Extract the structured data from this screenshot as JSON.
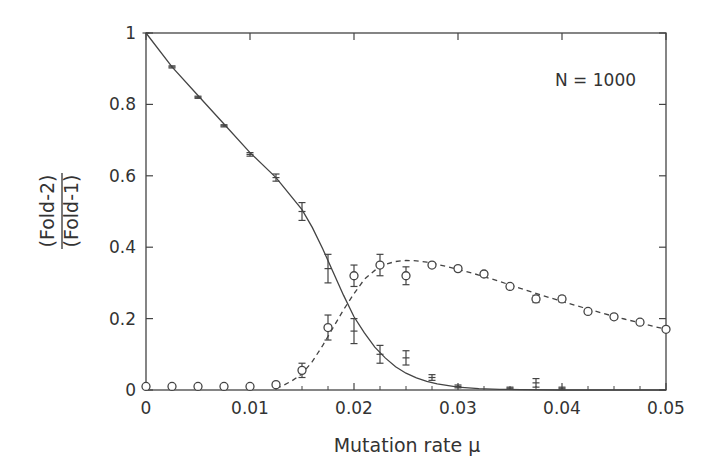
{
  "chart_data": {
    "type": "line",
    "title": "",
    "annotation": "N = 1000",
    "xlabel": "Mutation rate μ",
    "ylabel_numerator": "(Fold-2)",
    "ylabel_denominator": "(Fold-1)",
    "xlim": [
      0,
      0.05
    ],
    "ylim": [
      0,
      1
    ],
    "x_ticks": [
      0,
      0.01,
      0.02,
      0.03,
      0.04,
      0.05
    ],
    "x_tick_labels": [
      "0",
      "0.01",
      "0.02",
      "0.03",
      "0.04",
      "0.05"
    ],
    "x_minor_ticks": [
      0.0025,
      0.005,
      0.0075,
      0.0125,
      0.015,
      0.0175,
      0.0225,
      0.025,
      0.0275,
      0.0325,
      0.035,
      0.0375,
      0.0425,
      0.045,
      0.0475
    ],
    "y_ticks": [
      0,
      0.2,
      0.4,
      0.6,
      0.8,
      1
    ],
    "y_tick_labels": [
      "0",
      "0.2",
      "0.4",
      "0.6",
      "0.8",
      "1"
    ],
    "grid": false,
    "legend": null,
    "series": [
      {
        "name": "Fold-1 (simulation, bars)",
        "style": "solid",
        "marker": "bar",
        "x": [
          0,
          0.0025,
          0.005,
          0.0075,
          0.01,
          0.0125,
          0.015,
          0.0175,
          0.02,
          0.0225,
          0.025,
          0.0275,
          0.03,
          0.035,
          0.0375,
          0.04
        ],
        "y": [
          1.0,
          0.905,
          0.82,
          0.74,
          0.66,
          0.595,
          0.5,
          0.34,
          0.165,
          0.1,
          0.09,
          0.035,
          0.01,
          0.005,
          0.02,
          0.005
        ],
        "err": [
          0,
          0.003,
          0.003,
          0.003,
          0.005,
          0.01,
          0.025,
          0.04,
          0.035,
          0.025,
          0.02,
          0.008,
          0.004,
          0.003,
          0.012,
          0.003
        ]
      },
      {
        "name": "Fold-2 (simulation, circles)",
        "style": "dashed",
        "marker": "circle",
        "x": [
          0,
          0.0025,
          0.005,
          0.0075,
          0.01,
          0.0125,
          0.015,
          0.0175,
          0.02,
          0.0225,
          0.025,
          0.0275,
          0.03,
          0.0325,
          0.035,
          0.0375,
          0.04,
          0.0425,
          0.045,
          0.0475,
          0.05
        ],
        "y": [
          0.01,
          0.01,
          0.01,
          0.01,
          0.01,
          0.015,
          0.055,
          0.175,
          0.32,
          0.35,
          0.32,
          0.35,
          0.34,
          0.325,
          0.29,
          0.255,
          0.255,
          0.22,
          0.205,
          0.19,
          0.17
        ],
        "err": [
          0,
          0,
          0,
          0,
          0,
          0.004,
          0.02,
          0.035,
          0.03,
          0.03,
          0.025,
          0.006,
          0.006,
          0.006,
          0.006,
          0.01,
          0.008,
          0.006,
          0.006,
          0.006,
          0
        ]
      }
    ],
    "theory_curves": [
      {
        "name": "Fold-1 theory",
        "style": "solid",
        "x": [
          0,
          0.0025,
          0.005,
          0.0075,
          0.01,
          0.0125,
          0.015,
          0.016,
          0.017,
          0.018,
          0.019,
          0.02,
          0.021,
          0.022,
          0.023,
          0.024,
          0.025,
          0.026,
          0.027,
          0.028,
          0.03,
          0.032,
          0.034,
          0.036,
          0.04,
          0.05
        ],
        "y": [
          1.0,
          0.905,
          0.825,
          0.745,
          0.665,
          0.595,
          0.505,
          0.455,
          0.395,
          0.33,
          0.265,
          0.205,
          0.16,
          0.12,
          0.09,
          0.065,
          0.047,
          0.034,
          0.024,
          0.017,
          0.008,
          0.004,
          0.002,
          0.001,
          0.0,
          0.0
        ]
      },
      {
        "name": "Fold-2 theory",
        "style": "dashed",
        "x": [
          0.0125,
          0.013,
          0.014,
          0.015,
          0.016,
          0.017,
          0.018,
          0.019,
          0.02,
          0.021,
          0.022,
          0.023,
          0.024,
          0.025,
          0.026,
          0.027,
          0.028,
          0.03,
          0.032,
          0.034,
          0.036,
          0.038,
          0.04,
          0.042,
          0.044,
          0.046,
          0.048,
          0.05
        ],
        "y": [
          0.005,
          0.01,
          0.025,
          0.045,
          0.08,
          0.125,
          0.175,
          0.225,
          0.27,
          0.31,
          0.335,
          0.352,
          0.36,
          0.363,
          0.362,
          0.358,
          0.352,
          0.338,
          0.322,
          0.304,
          0.285,
          0.266,
          0.248,
          0.231,
          0.214,
          0.199,
          0.184,
          0.17
        ]
      }
    ]
  }
}
